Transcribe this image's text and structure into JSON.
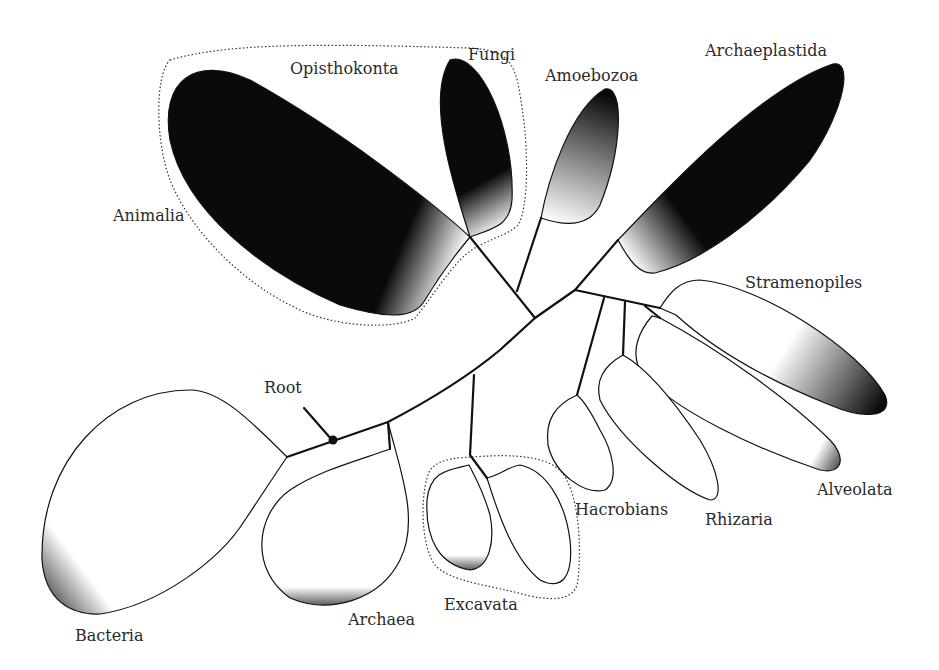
{
  "diagram": {
    "type": "unrooted phylogenetic tree of life",
    "labels": {
      "opisthokonta": "Opisthokonta",
      "fungi": "Fungi",
      "amoebozoa": "Amoebozoa",
      "archaeplastida": "Archaeplastida",
      "animalia": "Animalia",
      "stramenopiles": "Stramenopiles",
      "root": "Root",
      "hacrobians": "Hacrobians",
      "rhizaria": "Rhizaria",
      "alveolata": "Alveolata",
      "excavata": "Excavata",
      "archaea": "Archaea",
      "bacteria": "Bacteria"
    },
    "colors": {
      "line": "#111111",
      "fill_dark": "#0a0a0a",
      "fill_light": "#ffffff",
      "text": "#2a2a2a"
    },
    "supergroups_dotted": [
      "Opisthokonta",
      "Excavata"
    ],
    "root_marker": "filled-circle"
  }
}
